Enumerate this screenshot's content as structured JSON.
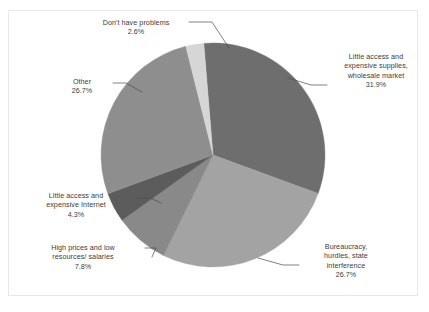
{
  "chart_data": {
    "type": "pie",
    "title": "",
    "categories": [
      "Little access and expensive supplies, wholesale market",
      "Bureaucracy, hurdles, state interference",
      "High prices and low resources/ salaries",
      "Little access and expensive Internet",
      "Other",
      "Don't have problems"
    ],
    "values": [
      31.9,
      26.7,
      7.8,
      4.3,
      26.7,
      2.6
    ],
    "value_suffix": "%",
    "legend": "none",
    "labels_position": "outside-with-leader-lines",
    "colors": [
      "#6e6e6e",
      "#a3a3a3",
      "#898989",
      "#5c5c5c",
      "#8e8e8e",
      "#d6d6d6"
    ],
    "start_angle_deg": -4.7,
    "direction": "clockwise"
  },
  "slices": [
    {
      "name": "supplies",
      "lines": [
        "Little access and",
        "expensive supplies,",
        "wholesale market"
      ],
      "percent": "31.9%",
      "color": "#6e6e6e"
    },
    {
      "name": "bureaucracy",
      "lines": [
        "Bureaucracy,",
        "hurdles, state",
        "interference"
      ],
      "percent": "26.7%",
      "color": "#a3a3a3"
    },
    {
      "name": "high-prices",
      "lines": [
        "High prices and low",
        "resources/ salaries"
      ],
      "percent": "7.8%",
      "color": "#898989"
    },
    {
      "name": "internet",
      "lines": [
        "Little access and",
        "expensive Internet"
      ],
      "percent": "4.3%",
      "color": "#5c5c5c"
    },
    {
      "name": "other",
      "lines": [
        "Other"
      ],
      "percent": "26.7%",
      "color": "#8e8e8e"
    },
    {
      "name": "dont-have-problems",
      "lines": [
        "Don't have problems"
      ],
      "percent": "2.6%",
      "color": "#d6d6d6"
    }
  ],
  "labels": {
    "dont_have_problems_l1": "Don't have problems",
    "dont_have_problems_pct": "2.6%",
    "supplies_l1": "Little access and",
    "supplies_l2": "expensive supplies,",
    "supplies_l3": "wholesale market",
    "supplies_pct": "31.9%",
    "bureaucracy_l1": "Bureaucracy,",
    "bureaucracy_l2": "hurdles, state",
    "bureaucracy_l3": "interference",
    "bureaucracy_pct": "26.7%",
    "high_prices_l1": "High prices and low",
    "high_prices_l2": "resources/ salaries",
    "high_prices_pct": "7.8%",
    "internet_l1": "Little access and",
    "internet_l2": "expensive Internet",
    "internet_pct": "4.3%",
    "other_l1": "Other",
    "other_pct": "26.7%"
  },
  "style": {
    "background": "#ffffff",
    "border_color": "#e8e8e8",
    "text_color": "#3d3d3d",
    "leader_line_color": "#4a4a4a"
  }
}
